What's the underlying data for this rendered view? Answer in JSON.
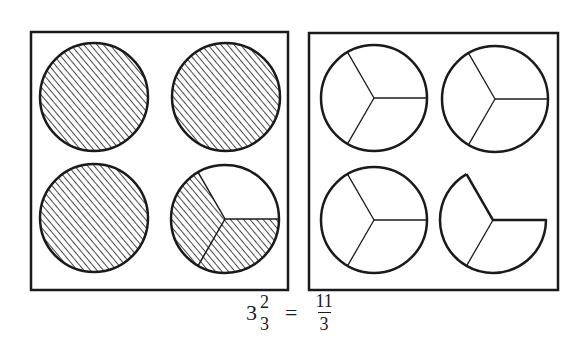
{
  "figure": {
    "colors": {
      "stroke": "#1a1a1a",
      "hatch": "#1a1a1a",
      "background": "#ffffff"
    },
    "left_panel": {
      "label": "shaded-wholes",
      "circles": [
        {
          "shaded_thirds": 3,
          "divided": false
        },
        {
          "shaded_thirds": 3,
          "divided": false
        },
        {
          "shaded_thirds": 3,
          "divided": false
        },
        {
          "shaded_thirds": 2,
          "divided": true
        }
      ]
    },
    "right_panel": {
      "label": "unshaded-thirds",
      "circles": [
        {
          "pieces": 3
        },
        {
          "pieces": 3
        },
        {
          "pieces": 3
        },
        {
          "pieces": 2
        }
      ]
    }
  },
  "equation": {
    "lhs_whole": "3",
    "lhs_numerator": "2",
    "lhs_denominator": "3",
    "equals": "=",
    "rhs_numerator": "11",
    "rhs_denominator": "3"
  }
}
